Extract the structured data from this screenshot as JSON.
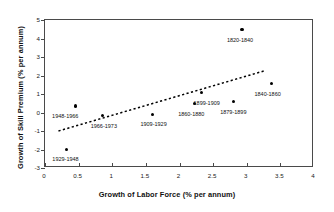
{
  "chart_data": {
    "type": "scatter",
    "title": "",
    "xlabel": "Growth of Labor Force (% per annum)",
    "ylabel": "Growth of Skill Premium (% per annum)",
    "xlim": [
      0,
      4
    ],
    "ylim": [
      -3,
      5
    ],
    "xticks": [
      "0",
      "0.5",
      "1",
      "1.5",
      "2",
      "2.5",
      "3",
      "3.5",
      "4"
    ],
    "xtick_values": [
      0,
      0.5,
      1,
      1.5,
      2,
      2.5,
      3,
      3.5,
      4
    ],
    "yticks": [
      "-3",
      "-2",
      "-1",
      "0",
      "1",
      "2",
      "3",
      "4",
      "5"
    ],
    "ytick_values": [
      -3,
      -2,
      -1,
      0,
      1,
      2,
      3,
      4,
      5
    ],
    "grid": false,
    "legend": false,
    "marker": "filled-circle",
    "marker_color": "#000000",
    "points": [
      {
        "label": "1929-1948",
        "x": 0.32,
        "y": -2.0,
        "label_dx": 0,
        "label_dy": 7
      },
      {
        "label": "1948-1966",
        "x": 0.45,
        "y": 0.35,
        "label_dx": -9,
        "label_dy": 8
      },
      {
        "label": "1966-1973",
        "x": 0.86,
        "y": -0.18,
        "label_dx": 2,
        "label_dy": 8
      },
      {
        "label": "1909-1929",
        "x": 1.6,
        "y": -0.1,
        "label_dx": 2,
        "label_dy": 8
      },
      {
        "label": "1860-1880",
        "x": 2.22,
        "y": 0.48,
        "label_dx": -2,
        "label_dy": 8
      },
      {
        "label": "1899-1909",
        "x": 2.33,
        "y": 1.07,
        "label_dx": 6,
        "label_dy": 8
      },
      {
        "label": "1879-1899",
        "x": 2.8,
        "y": 0.58,
        "label_dx": 1,
        "label_dy": 8
      },
      {
        "label": "1820-1840",
        "x": 2.93,
        "y": 4.48,
        "label_dx": -1,
        "label_dy": 8
      },
      {
        "label": "1840-1860",
        "x": 3.37,
        "y": 1.55,
        "label_dx": -3,
        "label_dy": 8
      }
    ],
    "trendline": {
      "style": "dashed",
      "color": "#000000",
      "x0": 0.2,
      "y0": -1.0,
      "x1": 3.26,
      "y1": 2.25
    }
  }
}
